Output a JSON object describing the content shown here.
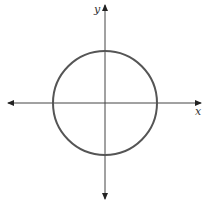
{
  "diagram": {
    "type": "circle-on-cartesian-axes",
    "x_axis_label": "x",
    "y_axis_label": "y",
    "circle": {
      "center": [
        0,
        0
      ],
      "note": "circle centered at origin"
    },
    "colors": {
      "axis": "#333333",
      "circle": "#555555",
      "background": "#ffffff"
    }
  }
}
